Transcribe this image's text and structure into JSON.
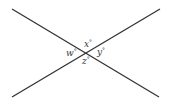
{
  "diagram": {
    "type": "intersecting-lines",
    "line_color": "#333333",
    "lines": [
      {
        "name": "line-descending",
        "x1": 12,
        "y1": 9,
        "x2": 159,
        "y2": 97
      },
      {
        "name": "line-ascending",
        "x1": 12,
        "y1": 97,
        "x2": 160,
        "y2": 9
      }
    ],
    "intersection": {
      "x": 86,
      "y": 53
    },
    "angles": [
      {
        "name": "angle-x",
        "var": "x",
        "degree": "°",
        "position": "top",
        "x": 84,
        "y": 47
      },
      {
        "name": "angle-w",
        "var": "w",
        "degree": "°",
        "position": "left",
        "x": 66,
        "y": 56
      },
      {
        "name": "angle-y",
        "var": "y",
        "degree": "°",
        "position": "right",
        "x": 97,
        "y": 55
      },
      {
        "name": "angle-z",
        "var": "z",
        "degree": "°",
        "position": "bottom",
        "x": 82,
        "y": 64
      }
    ]
  }
}
